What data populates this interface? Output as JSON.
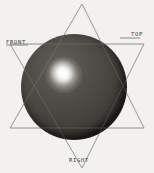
{
  "viewport": {
    "name": "3d-shaded-sphere-viewport",
    "width": 154,
    "height": 173,
    "background_color": "#f2f1ef"
  },
  "labels": {
    "front": "FRONT",
    "top": "TOP",
    "right": "RIGHT"
  },
  "wireframe": {
    "name": "star-construction-lines",
    "stroke_color": "#8a8a86",
    "stroke_color_dark": "#6f6f6b",
    "triangle_up": "82,4 10,128 144,128",
    "triangle_down": "10,44 144,44 82,168",
    "leader_front": "6,45 28,45",
    "leader_top": "120,38 140,38"
  },
  "sphere": {
    "name": "shaded-sphere",
    "center_x": 74,
    "center_y": 87,
    "radius": 53,
    "base_color": "#1a1916",
    "shadow_color": "#0d0c0a",
    "highlight_color": "#ffffff",
    "highlight_x": 62,
    "highlight_y": 72
  }
}
